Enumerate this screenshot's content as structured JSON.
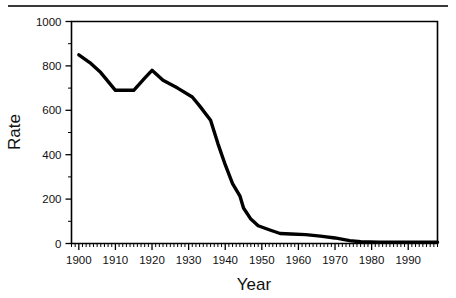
{
  "figure": {
    "top_rule": "horizontal-rule",
    "background_color": "#ffffff",
    "line_color": "#000000"
  },
  "chart_data": {
    "type": "line",
    "title": "",
    "xlabel": "Year",
    "ylabel": "Rate",
    "xlim": [
      1898,
      1998
    ],
    "ylim": [
      0,
      1000
    ],
    "grid": false,
    "legend": null,
    "x_ticks": [
      1900,
      1910,
      1920,
      1930,
      1940,
      1950,
      1960,
      1970,
      1980,
      1990
    ],
    "x_tick_labels": [
      "1900",
      "1910",
      "1920",
      "1930",
      "1940",
      "1950",
      "1960",
      "1970",
      "1980",
      "1990"
    ],
    "x_minor_tick_step": 1,
    "y_ticks": [
      0,
      200,
      400,
      600,
      800,
      1000
    ],
    "y_tick_labels": [
      "0",
      "200",
      "400",
      "600",
      "800",
      "1000"
    ],
    "y_minor_tick_step": 100,
    "series": [
      {
        "name": "Rate",
        "color": "#000000",
        "x": [
          1900,
          1903,
          1906,
          1910,
          1915,
          1918,
          1920,
          1923,
          1927,
          1931,
          1933,
          1936,
          1938,
          1940,
          1942,
          1944,
          1945,
          1947,
          1949,
          1952,
          1955,
          1958,
          1962,
          1966,
          1970,
          1974,
          1977,
          1982,
          1990,
          1998
        ],
        "y": [
          850,
          815,
          770,
          690,
          690,
          745,
          780,
          735,
          700,
          660,
          620,
          555,
          450,
          355,
          270,
          215,
          160,
          110,
          80,
          62,
          45,
          43,
          40,
          33,
          25,
          13,
          8,
          6,
          6,
          6
        ]
      }
    ]
  }
}
